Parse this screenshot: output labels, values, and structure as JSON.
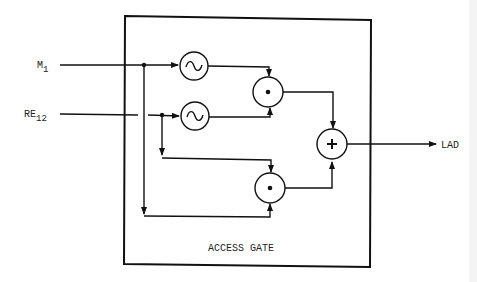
{
  "diagram": {
    "block_label": "ACCESS GATE",
    "inputs": [
      {
        "id": "m1",
        "base": "M",
        "subscript": "1"
      },
      {
        "id": "re12",
        "base": "RE",
        "subscript": "12"
      }
    ],
    "output": {
      "id": "lad",
      "label": "LAD"
    },
    "nodes": [
      {
        "id": "filter1",
        "type": "sine-source",
        "symbol": "~"
      },
      {
        "id": "filter2",
        "type": "sine-source",
        "symbol": "~"
      },
      {
        "id": "mult1",
        "type": "multiplier",
        "symbol": "•"
      },
      {
        "id": "mult2",
        "type": "multiplier",
        "symbol": "•"
      },
      {
        "id": "adder",
        "type": "summer",
        "symbol": "+"
      }
    ],
    "colors": {
      "line": "#111111",
      "background": "#ffffff"
    }
  }
}
